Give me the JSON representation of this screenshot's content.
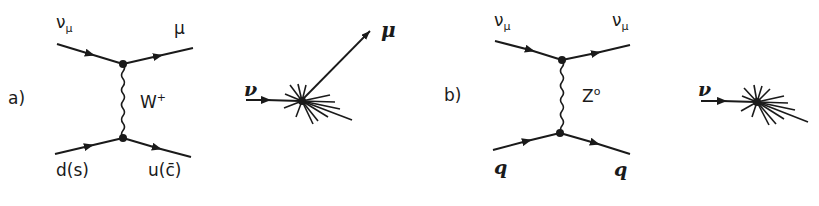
{
  "panel_a": {
    "label": "a)",
    "feynman": {
      "in_top": {
        "symbol": "ν",
        "subscript": "μ"
      },
      "out_top": {
        "symbol": "μ"
      },
      "boson": {
        "symbol": "W",
        "superscript": "+"
      },
      "in_bottom": "d(s)",
      "out_bottom": "u(c̄)"
    },
    "event": {
      "incoming": "ν",
      "outgoing_track": "μ"
    }
  },
  "panel_b": {
    "label": "b)",
    "feynman": {
      "in_top": {
        "symbol": "ν",
        "subscript": "μ"
      },
      "out_top": {
        "symbol": "ν",
        "subscript": "μ"
      },
      "boson": {
        "symbol": "Z",
        "superscript": "o"
      },
      "in_bottom": "q",
      "out_bottom": "q"
    },
    "event": {
      "incoming": "ν"
    }
  },
  "colors": {
    "ink": "#1a1a1a",
    "background": "#ffffff"
  }
}
